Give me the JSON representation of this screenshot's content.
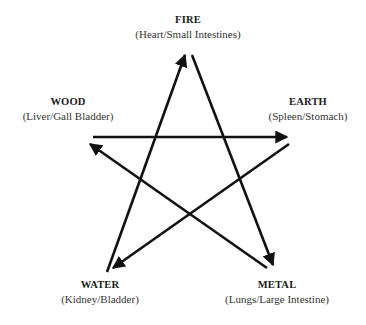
{
  "diagram": {
    "stroke_color": "#111111",
    "elements": [
      {
        "id": "fire",
        "name": "FIRE",
        "organs": "(Heart/Small Intestines)"
      },
      {
        "id": "wood",
        "name": "WOOD",
        "organs": "(Liver/Gall Bladder)"
      },
      {
        "id": "earth",
        "name": "EARTH",
        "organs": "(Spleen/Stomach)"
      },
      {
        "id": "water",
        "name": "WATER",
        "organs": "(Kidney/Bladder)"
      },
      {
        "id": "metal",
        "name": "METAL",
        "organs": "(Lungs/Large Intestine)"
      }
    ],
    "arrows": [
      {
        "from": "water",
        "to": "fire"
      },
      {
        "from": "fire",
        "to": "metal"
      },
      {
        "from": "metal",
        "to": "wood"
      },
      {
        "from": "wood",
        "to": "earth"
      },
      {
        "from": "earth",
        "to": "water"
      }
    ]
  }
}
